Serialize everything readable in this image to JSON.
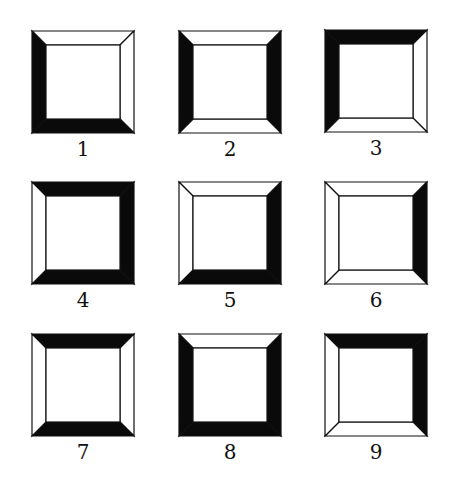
{
  "figure": {
    "colors": {
      "black": "#0a0a0a",
      "white": "#ffffff",
      "stroke": "#111111"
    },
    "frames": [
      {
        "label": "1",
        "top": "white",
        "right": "white",
        "bottom": "black",
        "left": "black"
      },
      {
        "label": "2",
        "top": "white",
        "right": "black",
        "bottom": "white",
        "left": "black"
      },
      {
        "label": "3",
        "top": "black",
        "right": "white",
        "bottom": "white",
        "left": "black"
      },
      {
        "label": "4",
        "top": "black",
        "right": "black",
        "bottom": "black",
        "left": "white"
      },
      {
        "label": "5",
        "top": "white",
        "right": "black",
        "bottom": "black",
        "left": "white"
      },
      {
        "label": "6",
        "top": "white",
        "right": "black",
        "bottom": "white",
        "left": "white"
      },
      {
        "label": "7",
        "top": "black",
        "right": "white",
        "bottom": "black",
        "left": "white"
      },
      {
        "label": "8",
        "top": "white",
        "right": "black",
        "bottom": "black",
        "left": "black"
      },
      {
        "label": "9",
        "top": "black",
        "right": "black",
        "bottom": "white",
        "left": "white"
      }
    ]
  }
}
